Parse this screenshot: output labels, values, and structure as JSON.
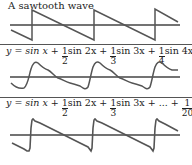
{
  "panels": [
    {
      "title": "A sawtooth wave",
      "description": "ideal sawtooth wave"
    },
    {
      "equation": {
        "prefix": "y = sin x +",
        "terms": [
          {
            "num": "1",
            "den": "2",
            "fn": "sin 2x +"
          },
          {
            "num": "1",
            "den": "3",
            "fn": "sin 3x +"
          },
          {
            "num": "1",
            "den": "4",
            "fn": "sin 4x"
          }
        ]
      },
      "description": "Fourier approximation with 4 terms"
    },
    {
      "equation": {
        "prefix": "y = sin x +",
        "terms": [
          {
            "num": "1",
            "den": "2",
            "fn": "sin 2x +"
          },
          {
            "num": "1",
            "den": "3",
            "fn": "sin 3x + ... +"
          },
          {
            "num": "1",
            "den": "20",
            "fn": "sin 20x"
          }
        ]
      },
      "description": "Fourier approximation with 20 terms"
    }
  ],
  "colors": {
    "wave": "#555555",
    "axis": "#444444",
    "divider": "#555555",
    "text": "#222222"
  }
}
